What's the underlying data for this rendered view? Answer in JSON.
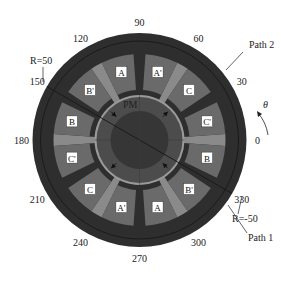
{
  "diagram": {
    "type": "motor cross-section",
    "angle_labels": [
      {
        "text": "0",
        "deg": 0
      },
      {
        "text": "30",
        "deg": 30
      },
      {
        "text": "60",
        "deg": 60
      },
      {
        "text": "90",
        "deg": 90
      },
      {
        "text": "120",
        "deg": 120
      },
      {
        "text": "150",
        "deg": 150
      },
      {
        "text": "180",
        "deg": 180
      },
      {
        "text": "210",
        "deg": 210
      },
      {
        "text": "240",
        "deg": 240
      },
      {
        "text": "270",
        "deg": 270
      },
      {
        "text": "300",
        "deg": 300
      },
      {
        "text": "330",
        "deg": 330
      }
    ],
    "coils": [
      {
        "label": "C'",
        "deg": 15
      },
      {
        "label": "C",
        "deg": 45
      },
      {
        "label": "A'",
        "deg": 75
      },
      {
        "label": "A",
        "deg": 105
      },
      {
        "label": "B'",
        "deg": 135
      },
      {
        "label": "B",
        "deg": 165
      },
      {
        "label": "C'",
        "deg": 195
      },
      {
        "label": "C",
        "deg": 225
      },
      {
        "label": "A'",
        "deg": 255
      },
      {
        "label": "A",
        "deg": 285
      },
      {
        "label": "B'",
        "deg": 315
      },
      {
        "label": "B",
        "deg": 345
      }
    ],
    "annotations": {
      "path1": "Path 1",
      "path2": "Path 2",
      "r_pos": "R=50",
      "r_neg": "R=-50",
      "pm": "PM",
      "theta": "θ"
    },
    "colors": {
      "yoke": "#2e2e2e",
      "coil": "#6a6a6a",
      "tooth": "#8a8a8a",
      "airgap": "#9a9a9a",
      "pm": "#4c4c4c",
      "core": "#363636"
    }
  }
}
